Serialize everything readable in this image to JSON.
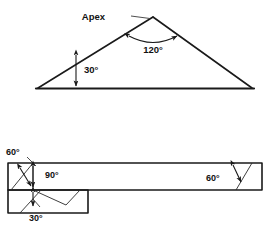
{
  "figure": {
    "background_color": "#ffffff",
    "line_color": "#1a1a1a",
    "text_color": "#111111"
  },
  "upper_diagram": {
    "name": "triangle-with-apex",
    "labels": {
      "apex": "Apex",
      "apex_angle": "120°",
      "base_angle": "30°"
    },
    "geometry": {
      "left_vertex": [
        38,
        88
      ],
      "apex_vertex": [
        153,
        17
      ],
      "right_vertex": [
        252,
        88
      ],
      "base_y": 88
    },
    "angles": {
      "apex_degrees": 120,
      "base_left_degrees": 30
    }
  },
  "lower_diagram": {
    "name": "stepped-bar-with-angles",
    "labels": {
      "top_left_angle": "60°",
      "inner_angle": "90°",
      "bottom_angle": "30°",
      "right_angle": "60°"
    },
    "geometry": {
      "upper_bar": [
        8,
        163,
        262,
        190
      ],
      "lower_block": [
        8,
        190,
        88,
        213
      ]
    },
    "angles": {
      "top_left_degrees": 60,
      "inner_degrees": 90,
      "bottom_degrees": 30,
      "right_degrees": 60
    }
  }
}
